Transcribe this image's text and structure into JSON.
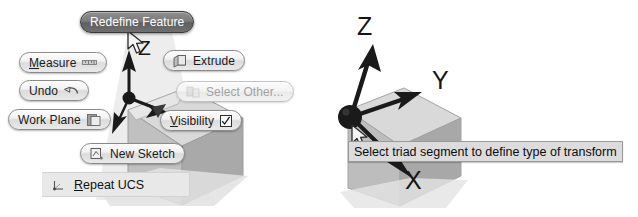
{
  "canvas": {
    "width": 638,
    "height": 217,
    "background": "#ffffff"
  },
  "left_panel": {
    "name": "marking-menu-over-3d-model",
    "selected_item": "Redefine Feature",
    "menu_items": [
      {
        "id": "redefine-feature",
        "label": "Redefine Feature",
        "icon": "none",
        "state": "selected",
        "mnemonic": ""
      },
      {
        "id": "measure",
        "label": "Measure",
        "icon": "ruler-icon",
        "state": "normal",
        "mnemonic": "M"
      },
      {
        "id": "undo",
        "label": "Undo",
        "icon": "undo-arrow-icon",
        "state": "normal",
        "mnemonic": ""
      },
      {
        "id": "work-plane",
        "label": "Work Plane",
        "icon": "plane-icon",
        "state": "normal",
        "mnemonic": ""
      },
      {
        "id": "extrude",
        "label": "Extrude",
        "icon": "extrude-icon",
        "state": "normal",
        "mnemonic": ""
      },
      {
        "id": "select-other",
        "label": "Select Other...",
        "icon": "select-other-icon",
        "state": "disabled",
        "mnemonic": ""
      },
      {
        "id": "visibility",
        "label": "Visibility",
        "icon": "checkbox-checked-icon",
        "state": "normal",
        "mnemonic": "V",
        "checked": true
      },
      {
        "id": "new-sketch",
        "label": "New Sketch",
        "icon": "sketch-icon",
        "state": "normal",
        "mnemonic": ""
      }
    ],
    "bottom_bar": {
      "id": "repeat-ucs",
      "label": "Repeat UCS",
      "icon": "ucs-triad-icon",
      "mnemonic": "R"
    },
    "axis_labels": [
      {
        "text": "Z"
      }
    ]
  },
  "right_panel": {
    "name": "transform-triad-on-3d-model",
    "axis_labels": [
      {
        "text": "Z",
        "axis": "z"
      },
      {
        "text": "Y",
        "axis": "y"
      },
      {
        "text": "X",
        "axis": "x"
      }
    ],
    "tooltip": {
      "text": "Select triad segment to define type of transform"
    },
    "cursor": {
      "icon": "arrow-cursor-icon"
    }
  },
  "colors": {
    "pill_border": "#8a8a8a",
    "pill_face": "#f2f2f2",
    "pill_selected_face": "#6f6f6f",
    "pill_selected_text": "#ffffff",
    "disabled_text": "#a3a3a3",
    "tooltip_bg": "#dcdcdc",
    "tooltip_border": "#9a9a9a",
    "triad_black": "#1a1a1a",
    "model_light": "#d8d8d8",
    "model_mid": "#bdbdbd",
    "model_dark": "#a8a8a8",
    "bar_bg": "#e8e8e8"
  }
}
